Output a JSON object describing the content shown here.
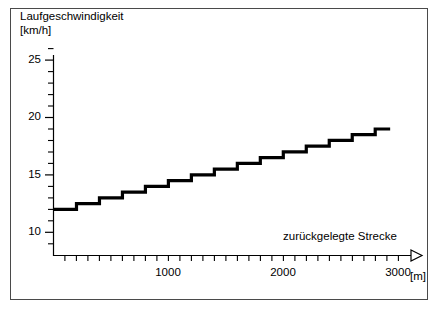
{
  "figure": {
    "background_color": "#ffffff",
    "frame_color": "#4a4a4a",
    "curve_color": "#000000"
  },
  "chart_data": {
    "type": "line",
    "title": "",
    "subtitle": "",
    "xlabel": "zurückgelegte Strecke",
    "xunit": "[m]",
    "ylabel": "Laufgeschwindigkeit",
    "yunit": "[km/h]",
    "ylabel_full": "Laufgeschwindigkeit\n[km/h]",
    "grid": false,
    "legend": false,
    "legend_position": "none",
    "step_style": "post",
    "xlim": [
      0,
      3000
    ],
    "ylim": [
      9,
      26
    ],
    "x_major_ticks": [
      1000,
      2000,
      3000
    ],
    "x_major_tick_labels": [
      "1000",
      "2000",
      "3000"
    ],
    "x_minor_tick_step": 100,
    "y_major_ticks": [
      10,
      15,
      20,
      25
    ],
    "y_major_tick_labels": [
      "10",
      "15",
      "20",
      "25"
    ],
    "y_minor_tick_step": 1,
    "x_axis_arrow": true,
    "series": [
      {
        "name": "Laufgeschwindigkeit",
        "x": [
          0,
          200,
          200,
          400,
          400,
          600,
          600,
          800,
          800,
          1000,
          1000,
          1200,
          1200,
          1400,
          1400,
          1600,
          1600,
          1800,
          1800,
          2000,
          2000,
          2200,
          2200,
          2400,
          2400,
          2600,
          2600,
          2800,
          2800,
          2930
        ],
        "y": [
          12.0,
          12.0,
          12.5,
          12.5,
          13.0,
          13.0,
          13.5,
          13.5,
          14.0,
          14.0,
          14.5,
          14.5,
          15.0,
          15.0,
          15.5,
          15.5,
          16.0,
          16.0,
          16.5,
          16.5,
          17.0,
          17.0,
          17.5,
          17.5,
          18.0,
          18.0,
          18.5,
          18.5,
          19.0,
          19.0
        ],
        "steps": [
          {
            "x_start": 0,
            "x_end": 200,
            "speed": 12.0
          },
          {
            "x_start": 200,
            "x_end": 400,
            "speed": 12.5
          },
          {
            "x_start": 400,
            "x_end": 600,
            "speed": 13.0
          },
          {
            "x_start": 600,
            "x_end": 800,
            "speed": 13.5
          },
          {
            "x_start": 800,
            "x_end": 1000,
            "speed": 14.0
          },
          {
            "x_start": 1000,
            "x_end": 1200,
            "speed": 14.5
          },
          {
            "x_start": 1200,
            "x_end": 1400,
            "speed": 15.0
          },
          {
            "x_start": 1400,
            "x_end": 1600,
            "speed": 15.5
          },
          {
            "x_start": 1600,
            "x_end": 1800,
            "speed": 16.0
          },
          {
            "x_start": 1800,
            "x_end": 2000,
            "speed": 16.5
          },
          {
            "x_start": 2000,
            "x_end": 2200,
            "speed": 17.0
          },
          {
            "x_start": 2200,
            "x_end": 2400,
            "speed": 17.5
          },
          {
            "x_start": 2400,
            "x_end": 2600,
            "speed": 18.0
          },
          {
            "x_start": 2600,
            "x_end": 2800,
            "speed": 18.5
          },
          {
            "x_start": 2800,
            "x_end": 2930,
            "speed": 19.0
          }
        ]
      }
    ]
  }
}
